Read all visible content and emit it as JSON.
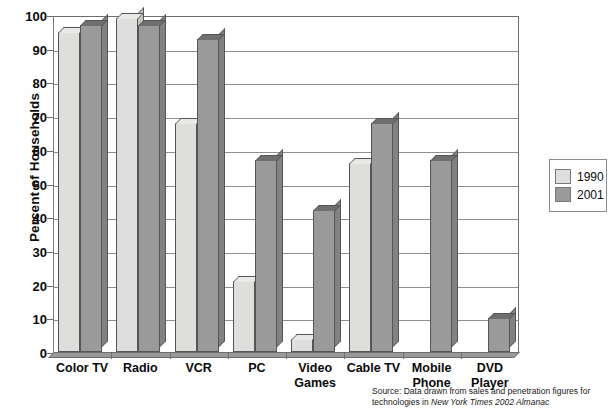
{
  "chart_data": {
    "type": "bar",
    "title": "",
    "xlabel": "",
    "ylabel": "Percent of Households",
    "ylim": [
      0,
      100
    ],
    "ytick_values": [
      0,
      10,
      20,
      30,
      40,
      50,
      60,
      70,
      80,
      90,
      100
    ],
    "ytick_labels": [
      "0",
      "10",
      "20",
      "30",
      "40",
      "50",
      "60",
      "70",
      "80",
      "90",
      "100"
    ],
    "grid": true,
    "legend_position": "right",
    "categories": [
      "Color TV",
      "Radio",
      "VCR",
      "PC",
      "Video\nGames",
      "Cable TV",
      "Mobile\nPhone",
      "DVD\nPlayer"
    ],
    "series": [
      {
        "name": "1990",
        "color": "#dededc",
        "values": [
          95,
          99,
          68,
          21,
          4,
          56,
          0,
          0
        ]
      },
      {
        "name": "2001",
        "color": "#9a9a9a",
        "values": [
          97,
          97,
          93,
          57,
          42,
          68,
          57,
          10
        ]
      }
    ],
    "source_note_line1": "Source: Data drawn from sales and penetration figures for technologies in",
    "source_note_line2": "New York Times 2002 Almanac"
  },
  "legend": {
    "items": [
      {
        "label": "1990"
      },
      {
        "label": "2001"
      }
    ]
  }
}
